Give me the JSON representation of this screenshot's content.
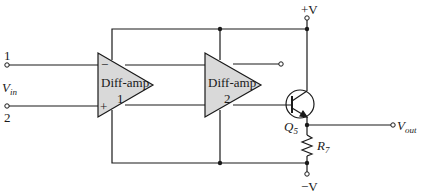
{
  "diagram": {
    "type": "circuit-schematic",
    "colors": {
      "line": "#1a1a1a",
      "amp_fill": "#d9d9d9",
      "background": "#ffffff"
    },
    "inputs": {
      "terminal_1": "1",
      "terminal_2": "2",
      "vin_main": "V",
      "vin_sub": "in"
    },
    "amplifiers": [
      {
        "name": "Diff-amp",
        "number": "1",
        "minus": "−",
        "plus": "+"
      },
      {
        "name": "Diff-amp",
        "number": "2"
      }
    ],
    "transistor": {
      "main": "Q",
      "sub": "5"
    },
    "resistor": {
      "main": "R",
      "sub": "7"
    },
    "supply": {
      "positive": "+V",
      "negative": "−V"
    },
    "output": {
      "main": "V",
      "sub": "out"
    }
  }
}
